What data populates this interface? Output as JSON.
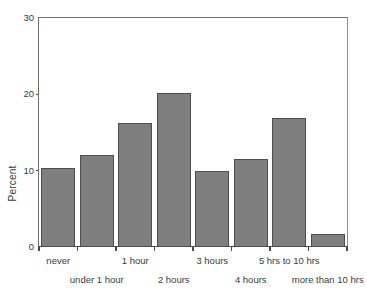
{
  "chart_data": {
    "type": "bar",
    "title": "",
    "xlabel": "",
    "ylabel": "Percent",
    "ylim": [
      0,
      30
    ],
    "yticks": [
      0,
      10,
      20,
      30
    ],
    "ytick_labels": [
      "0",
      "10",
      "20",
      "30"
    ],
    "grid": false,
    "legend": null,
    "categories": [
      "never",
      "under 1 hour",
      "1 hour",
      "2 hours",
      "3 hours",
      "4 hours",
      "5 hrs to 10 hrs",
      "more than 10 hrs"
    ],
    "label_rows": [
      0,
      1,
      0,
      1,
      0,
      1,
      0,
      1
    ],
    "values": [
      10.3,
      12.1,
      16.3,
      20.2,
      9.9,
      11.5,
      16.9,
      1.7
    ],
    "bar_color": "#7f7f7f",
    "bar_edge_color": "#4d4d4d",
    "axis_color": "#4a4a4a",
    "background_color": "#ffffff",
    "text_color": "#3a3a3a"
  }
}
